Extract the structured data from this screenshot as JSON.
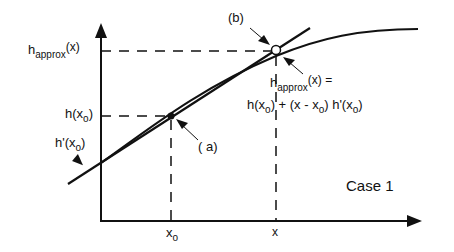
{
  "diagram": {
    "case_label": "Case 1",
    "y_labels": {
      "h_approx": {
        "base": "h",
        "sub": "approx",
        "arg": "(x)"
      },
      "h_x0": {
        "base": "h(x",
        "sub": "o",
        "close": ")"
      },
      "h_prime_x0": {
        "base": "h'(x",
        "sub": "o",
        "close": ")"
      }
    },
    "x_labels": {
      "x0": {
        "base": "x",
        "sub": "o"
      },
      "x": "x"
    },
    "points": {
      "a": {
        "label": "( a)",
        "style": "filled",
        "description": "point of tangency at x0"
      },
      "b": {
        "label": "(b)",
        "style": "open",
        "description": "approximation on tangent line at x"
      }
    },
    "equation": {
      "line1_base": "h",
      "line1_sub": "approx",
      "line1_rest": "(x) =",
      "line2_parts": [
        "h(x",
        "o",
        ") + (x - x",
        "o",
        ") h'(x",
        "o",
        ")"
      ]
    },
    "colors": {
      "ink": "#111111",
      "background": "#ffffff"
    }
  }
}
